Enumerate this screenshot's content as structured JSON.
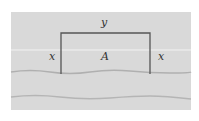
{
  "diagram": {
    "labels": {
      "top_side": "y",
      "left_side": "x",
      "right_side": "x",
      "area": "A"
    },
    "colors": {
      "background": "#d9d9d9",
      "fence": "#555555",
      "river_line": "#b5b5b5",
      "highlight_line": "#f0f0f0"
    }
  }
}
